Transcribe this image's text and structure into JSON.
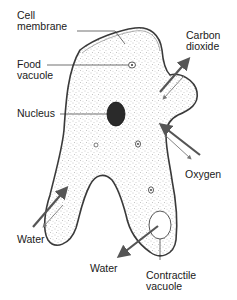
{
  "labels": {
    "cell_membrane": [
      "Cell",
      "membrane"
    ],
    "food_vacuole": [
      "Food",
      "vacuole"
    ],
    "nucleus": "Nucleus",
    "carbon_dioxide": [
      "Carbon",
      "dioxide"
    ],
    "oxygen": "Oxygen",
    "water_left": "Water",
    "water_bottom": "Water",
    "contractile_vacuole": [
      "Contractile",
      "vacuole"
    ]
  },
  "colors": {
    "outline": "#3a3a3a",
    "stipple": "#8a8a8a",
    "nucleus": "#2a2a2a",
    "arrow": "#555555",
    "background": "#ffffff"
  }
}
